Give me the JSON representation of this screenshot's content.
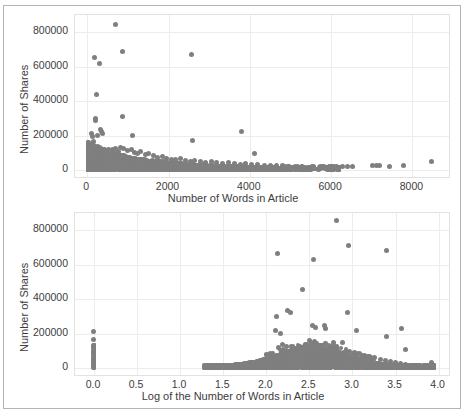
{
  "figure": {
    "background": "#ffffff",
    "border_color": "#b4b4b4",
    "marker_color": "#7f7f7f",
    "grid_color": "#ececec"
  },
  "chart_data": [
    {
      "id": "shares-vs-words",
      "type": "scatter",
      "title": "",
      "xlabel": "Number of Words in Article",
      "ylabel": "Number of Shares",
      "xlim": [
        -300,
        8900
      ],
      "ylim": [
        -40000,
        900000
      ],
      "xticks": [
        "0",
        "2000",
        "4000",
        "6000",
        "8000"
      ],
      "xtick_values": [
        0,
        2000,
        4000,
        6000,
        8000
      ],
      "yticks": [
        "0",
        "200000",
        "400000",
        "600000",
        "800000"
      ],
      "ytick_values": [
        0,
        200000,
        400000,
        600000,
        800000
      ],
      "grid": true,
      "legend": "none",
      "points": [
        [
          690,
          843300
        ],
        [
          880,
          690400
        ],
        [
          175,
          652900
        ],
        [
          310,
          617900
        ],
        [
          2560,
          670000
        ],
        [
          240,
          441200
        ],
        [
          205,
          298400
        ],
        [
          215,
          288800
        ],
        [
          860,
          310800
        ],
        [
          250,
          200800
        ],
        [
          330,
          233800
        ],
        [
          360,
          225900
        ],
        [
          375,
          210400
        ],
        [
          1120,
          203500
        ],
        [
          3790,
          223100
        ],
        [
          2590,
          170200
        ],
        [
          4110,
          98600
        ],
        [
          110,
          211500
        ],
        [
          130,
          196000
        ],
        [
          150,
          168000
        ],
        [
          90,
          143000
        ],
        [
          160,
          139000
        ],
        [
          200,
          131000
        ],
        [
          260,
          128000
        ],
        [
          300,
          124000
        ],
        [
          420,
          121000
        ],
        [
          520,
          119000
        ],
        [
          620,
          117000
        ],
        [
          700,
          126000
        ],
        [
          760,
          108000
        ],
        [
          830,
          133000
        ],
        [
          900,
          128000
        ],
        [
          980,
          112000
        ],
        [
          1080,
          120000
        ],
        [
          1160,
          102000
        ],
        [
          1240,
          98000
        ],
        [
          1320,
          109000
        ],
        [
          1430,
          92000
        ],
        [
          1520,
          99000
        ],
        [
          1640,
          86000
        ],
        [
          1740,
          74000
        ],
        [
          1850,
          80000
        ],
        [
          1960,
          70000
        ],
        [
          2080,
          64000
        ],
        [
          2180,
          60000
        ],
        [
          2290,
          66000
        ],
        [
          2410,
          56000
        ],
        [
          2530,
          52000
        ],
        [
          2650,
          58000
        ],
        [
          2780,
          48000
        ],
        [
          2900,
          45000
        ],
        [
          3050,
          50000
        ],
        [
          3190,
          42000
        ],
        [
          3340,
          40000
        ],
        [
          3480,
          44000
        ],
        [
          3620,
          36000
        ],
        [
          3760,
          34000
        ],
        [
          3900,
          38000
        ],
        [
          4050,
          30000
        ],
        [
          4200,
          32000
        ],
        [
          4350,
          28000
        ],
        [
          4500,
          26000
        ],
        [
          4650,
          29000
        ],
        [
          4800,
          24000
        ],
        [
          4960,
          22000
        ],
        [
          5180,
          20000
        ],
        [
          5560,
          19000
        ],
        [
          6140,
          23000
        ],
        [
          6290,
          22000
        ],
        [
          6400,
          23000
        ],
        [
          6520,
          22000
        ],
        [
          7020,
          25000
        ],
        [
          7120,
          26000
        ],
        [
          7200,
          25000
        ],
        [
          7440,
          23000
        ],
        [
          7790,
          24000
        ],
        [
          8480,
          48000
        ]
      ],
      "cluster_note": "Dense mass of points between x=0 and x=5000 with y below ~120000"
    },
    {
      "id": "shares-vs-log-words",
      "type": "scatter",
      "title": "",
      "xlabel": "Log of the Number of Words in Article",
      "ylabel": "Number of Shares",
      "xlim": [
        -0.22,
        4.12
      ],
      "ylim": [
        -40000,
        900000
      ],
      "xticks": [
        "0.0",
        "0.5",
        "1.0",
        "1.5",
        "2.0",
        "2.5",
        "3.0",
        "3.5",
        "4.0"
      ],
      "xtick_values": [
        0.0,
        0.5,
        1.0,
        1.5,
        2.0,
        2.5,
        3.0,
        3.5,
        4.0
      ],
      "yticks": [
        "0",
        "200000",
        "400000",
        "600000",
        "800000"
      ],
      "ytick_values": [
        0,
        200000,
        400000,
        600000,
        800000
      ],
      "grid": true,
      "legend": "none",
      "points": [
        [
          2.82,
          855000
        ],
        [
          2.95,
          710000
        ],
        [
          3.4,
          685000
        ],
        [
          2.13,
          665000
        ],
        [
          2.55,
          632000
        ],
        [
          2.42,
          458000
        ],
        [
          2.94,
          325000
        ],
        [
          2.28,
          322000
        ],
        [
          2.25,
          332000
        ],
        [
          2.12,
          300000
        ],
        [
          2.11,
          220000
        ],
        [
          2.17,
          200000
        ],
        [
          2.54,
          245000
        ],
        [
          2.57,
          238000
        ],
        [
          2.68,
          248000
        ],
        [
          2.69,
          232000
        ],
        [
          3.05,
          218000
        ],
        [
          3.57,
          232000
        ],
        [
          3.4,
          182000
        ],
        [
          2.5,
          160000
        ],
        [
          2.56,
          152000
        ],
        [
          2.78,
          150000
        ],
        [
          2.88,
          148000
        ],
        [
          3.62,
          108000
        ],
        [
          0.0,
          211000
        ],
        [
          0.0,
          165000
        ],
        [
          0.0,
          132000
        ],
        [
          0.0,
          118000
        ],
        [
          0.0,
          104000
        ],
        [
          0.0,
          92000
        ],
        [
          0.0,
          78000
        ],
        [
          0.0,
          64000
        ],
        [
          0.0,
          52000
        ],
        [
          0.0,
          40000
        ],
        [
          0.0,
          28000
        ],
        [
          0.0,
          14000
        ],
        [
          0.0,
          4000
        ],
        [
          1.28,
          9000
        ],
        [
          1.36,
          11000
        ],
        [
          1.45,
          12000
        ],
        [
          1.55,
          14000
        ],
        [
          1.64,
          16000
        ],
        [
          1.72,
          18000
        ],
        [
          1.8,
          22000
        ],
        [
          1.88,
          28000
        ],
        [
          1.95,
          34000
        ],
        [
          2.02,
          44000
        ],
        [
          2.08,
          60000
        ],
        [
          2.14,
          122000
        ],
        [
          2.19,
          135000
        ],
        [
          2.24,
          128000
        ],
        [
          2.3,
          120000
        ],
        [
          2.36,
          112000
        ],
        [
          2.42,
          105000
        ],
        [
          2.48,
          100000
        ],
        [
          2.54,
          98000
        ],
        [
          2.6,
          96000
        ],
        [
          2.66,
          100000
        ],
        [
          2.72,
          104000
        ],
        [
          2.78,
          98000
        ],
        [
          2.84,
          94000
        ],
        [
          2.9,
          92000
        ],
        [
          2.96,
          95000
        ],
        [
          3.02,
          90000
        ],
        [
          3.08,
          84000
        ],
        [
          3.14,
          76000
        ],
        [
          3.2,
          70000
        ],
        [
          3.26,
          62000
        ],
        [
          3.32,
          52000
        ],
        [
          3.38,
          44000
        ],
        [
          3.44,
          36000
        ],
        [
          3.5,
          30000
        ],
        [
          3.56,
          26000
        ],
        [
          3.62,
          22000
        ],
        [
          3.7,
          18000
        ],
        [
          3.78,
          16000
        ],
        [
          3.86,
          18000
        ],
        [
          3.92,
          30000
        ]
      ],
      "cluster_note": "Dense hump of points from x≈1.3 to x≈3.95 peaking near x≈2.5, plus a vertical stripe at x=0.0"
    }
  ]
}
